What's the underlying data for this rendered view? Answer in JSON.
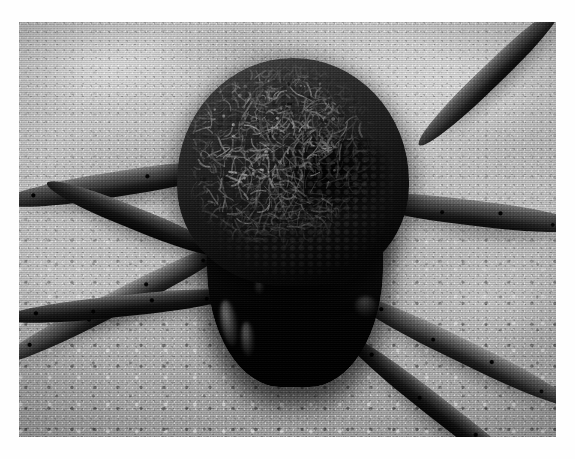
{
  "image": {
    "kind": "photograph",
    "medium": "scanned black-and-white print",
    "subject": "wolf spider carrying spiderlings on its abdomen",
    "caption": "",
    "alt_text": "Grainy black-and-white macro photograph of a large wolf spider resting on rough concrete, its abdomen completely covered by a dense mass of tiny spiderlings.",
    "frame": {
      "x": 19,
      "y": 22,
      "width": 537,
      "height": 415
    },
    "canvas": {
      "width": 575,
      "height": 459
    },
    "margin_color": "#ffffff",
    "palette": {
      "paper_white": "#ffffff",
      "concrete_light": "#c9c9c9",
      "concrete_mid": "#b5b5b5",
      "concrete_dark": "#a4a4a4",
      "leg_highlight": "#8e8e8e",
      "leg_mid": "#4d4d4d",
      "leg_shadow": "#1c1c1c",
      "body_black": "#070707",
      "spiderling_highlight": "#9a9a9a"
    },
    "tone": {
      "grayscale": true,
      "contrast": "high",
      "grain": "heavy"
    }
  },
  "scene": {
    "background": {
      "name": "concrete-surface",
      "description": "coarse pale grey concrete or stucco slab, smoother and cloudier toward the top, visibly pitted and granular toward the bottom"
    },
    "lighting": {
      "direction": "front-top",
      "shadow": "soft dark shadow pooling beneath the spider's body and legs"
    },
    "subject_parts": [
      {
        "name": "spiderling-mass",
        "description": "dense tangle of dozens of tiny pale spiderlings with thread-thin legs blanketing the abdomen"
      },
      {
        "name": "abdomen",
        "description": "bulbous rear body, nearly black, almost entirely hidden by young"
      },
      {
        "name": "cephalothorax",
        "description": "dark front body section facing the camera"
      },
      {
        "name": "legs",
        "description": "eight banded legs splayed outward, bearing scattered dark bristles and spines"
      }
    ]
  },
  "legs": [
    {
      "id": "left-front-upper",
      "x": -18,
      "y": 168,
      "length": 236,
      "thickness": 25,
      "angle": -9,
      "tone": "leg-mid",
      "spines": true
    },
    {
      "id": "left-front-lower",
      "x": -22,
      "y": 330,
      "length": 268,
      "thickness": 23,
      "angle": -27,
      "tone": "leg-lite",
      "spines": true
    },
    {
      "id": "left-mid",
      "x": -16,
      "y": 286,
      "length": 238,
      "thickness": 21,
      "angle": -6,
      "tone": "leg-dark",
      "spines": true
    },
    {
      "id": "left-rear",
      "x": 28,
      "y": 150,
      "length": 190,
      "thickness": 22,
      "angle": 22,
      "tone": "leg-dark",
      "spines": false
    },
    {
      "id": "right-rear-upper",
      "x": 400,
      "y": 112,
      "length": 196,
      "thickness": 22,
      "angle": -44,
      "tone": "leg-mid",
      "spines": false
    },
    {
      "id": "right-front-upper",
      "x": 336,
      "y": 164,
      "length": 232,
      "thickness": 25,
      "angle": 7,
      "tone": "leg-mid",
      "spines": true
    },
    {
      "id": "right-mid",
      "x": 330,
      "y": 262,
      "length": 250,
      "thickness": 23,
      "angle": 26,
      "tone": "leg-lite",
      "spines": true
    },
    {
      "id": "right-front-lower",
      "x": 322,
      "y": 300,
      "length": 268,
      "thickness": 22,
      "angle": 38,
      "tone": "leg-dark",
      "spines": true
    }
  ],
  "highlights": [
    {
      "id": "palp-left",
      "x": 202,
      "y": 278,
      "w": 16,
      "h": 46,
      "angle": -10,
      "opacity": 0.5
    },
    {
      "id": "palp-inner",
      "x": 222,
      "y": 300,
      "w": 13,
      "h": 34,
      "angle": -4,
      "opacity": 0.4
    },
    {
      "id": "chelicera",
      "x": 246,
      "y": 232,
      "w": 14,
      "h": 22,
      "angle": 8,
      "opacity": 0.42
    },
    {
      "id": "fang-glint",
      "x": 236,
      "y": 258,
      "w": 9,
      "h": 14,
      "angle": 0,
      "opacity": 0.33
    },
    {
      "id": "joint-right",
      "x": 336,
      "y": 274,
      "w": 22,
      "h": 20,
      "angle": 14,
      "opacity": 0.26
    }
  ]
}
